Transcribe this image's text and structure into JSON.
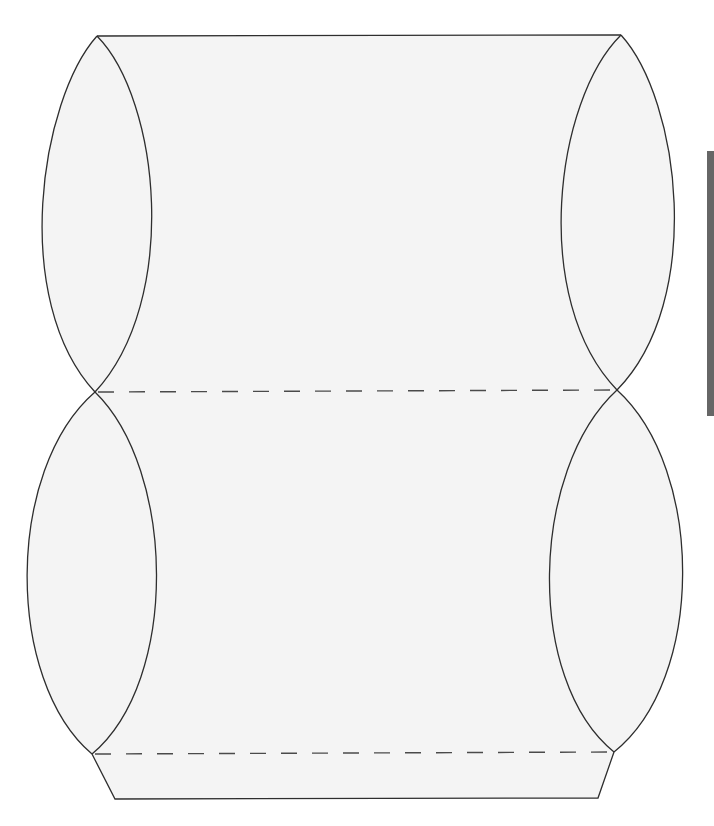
{
  "diagram": {
    "type": "pillow-box-template",
    "colors": {
      "background": "#ffffff",
      "panel_fill": "#f4f4f4",
      "cut_line": "#2e2e2e",
      "fold_line": "#4a4a4a",
      "side_bar": "#666666"
    },
    "panels": [
      {
        "name": "top-panel",
        "corners": [
          [
            97,
            36
          ],
          [
            621,
            35
          ],
          [
            617,
            390
          ],
          [
            95,
            392
          ]
        ]
      },
      {
        "name": "bottom-panel",
        "corners": [
          [
            95,
            392
          ],
          [
            617,
            390
          ],
          [
            614,
            752
          ],
          [
            92,
            754
          ]
        ]
      },
      {
        "name": "glue-flap",
        "corners": [
          [
            92,
            754
          ],
          [
            614,
            752
          ],
          [
            598,
            798
          ],
          [
            115,
            799
          ]
        ]
      }
    ],
    "lobes": [
      {
        "name": "top-left-lobe",
        "outer_x": 23,
        "inner_x": 168
      },
      {
        "name": "top-right-lobe",
        "outer_x": 691,
        "inner_x": 547
      },
      {
        "name": "bottom-left-lobe",
        "outer_x": 18,
        "inner_x": 166
      },
      {
        "name": "bottom-right-lobe",
        "outer_x": 688,
        "inner_x": 542
      }
    ],
    "fold_lines": [
      {
        "name": "middle-fold",
        "from": [
          95,
          392
        ],
        "to": [
          617,
          390
        ],
        "style": "dashed"
      },
      {
        "name": "flap-fold",
        "from": [
          92,
          754
        ],
        "to": [
          614,
          752
        ],
        "style": "dashed"
      }
    ]
  }
}
